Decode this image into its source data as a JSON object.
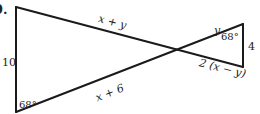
{
  "problem": {
    "number_label": "9."
  },
  "figure": {
    "type": "two triangles sharing a vertex (bowtie)",
    "labels": {
      "left_side": "10",
      "top_segment": "x + y",
      "bottom_segment": "x + 6",
      "right_upper_segment": "y",
      "right_lower_segment": "2 (x − y)",
      "right_side": "4",
      "angle_bottom_left": "68°",
      "angle_top_right": "68°"
    }
  }
}
